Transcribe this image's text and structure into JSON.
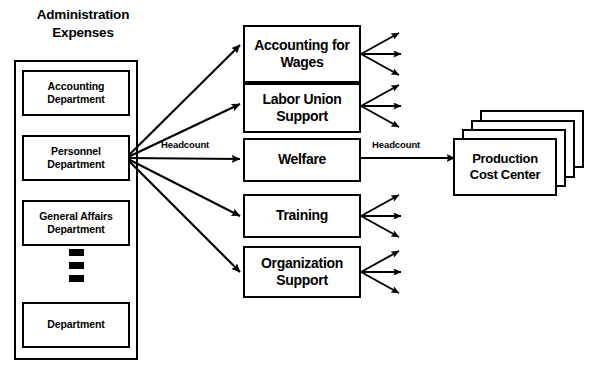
{
  "diagram": {
    "title_line1": "Administration",
    "title_line2": "Expenses",
    "departments": [
      {
        "name": "Accounting Department",
        "line1": "Accounting",
        "line2": "Department"
      },
      {
        "name": "Personnel Department",
        "line1": "Personnel",
        "line2": "Department"
      },
      {
        "name": "General Affairs Department",
        "line1": "General Affairs",
        "line2": "Department"
      },
      {
        "name": "Department",
        "line1": "Department",
        "line2": ""
      }
    ],
    "ellipsis_marker": "vertical-ellipsis",
    "services": [
      {
        "name": "Accounting for Wages",
        "line1": "Accounting for",
        "line2": "Wages"
      },
      {
        "name": "Labor Union Support",
        "line1": "Labor Union",
        "line2": "Support"
      },
      {
        "name": "Welfare",
        "line1": "Welfare",
        "line2": ""
      },
      {
        "name": "Training",
        "line1": "Training",
        "line2": ""
      },
      {
        "name": "Organization Support",
        "line1": "Organization",
        "line2": "Support"
      }
    ],
    "cost_center": {
      "line1": "Production",
      "line2": "Cost Center",
      "stack_count": 4
    },
    "edge_labels": {
      "left": "Headcount",
      "right": "Headcount"
    },
    "colors": {
      "stroke": "#000000",
      "background": "#ffffff",
      "text": "#000000"
    }
  }
}
